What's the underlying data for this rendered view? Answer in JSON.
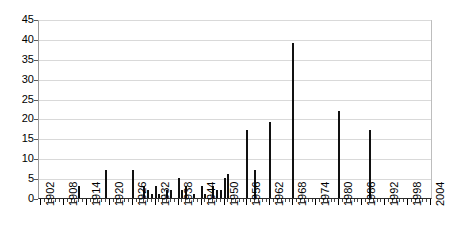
{
  "chart_data": {
    "type": "bar",
    "title": "",
    "xlabel": "",
    "ylabel": "",
    "ylim": [
      0,
      45
    ],
    "ytick_step": 5,
    "yticks": [
      0,
      5,
      10,
      15,
      20,
      25,
      30,
      35,
      40,
      45
    ],
    "xlim": [
      1902,
      2004
    ],
    "xtick_labels": [
      "1902",
      "1908",
      "1914",
      "1920",
      "1926",
      "1932",
      "1938",
      "1944",
      "1950",
      "1956",
      "1962",
      "1968",
      "1974",
      "1980",
      "1986",
      "1992",
      "1998",
      "2004"
    ],
    "xtick_step": 6,
    "grid": "horizontal",
    "legend": "none",
    "bar_color": "#111111",
    "grid_color": "#d9d9d9",
    "axis_color": "#2b2b2b",
    "categories": [
      1902,
      1903,
      1904,
      1905,
      1906,
      1907,
      1908,
      1909,
      1910,
      1911,
      1912,
      1913,
      1914,
      1915,
      1916,
      1917,
      1918,
      1919,
      1920,
      1921,
      1922,
      1923,
      1924,
      1925,
      1926,
      1927,
      1928,
      1929,
      1930,
      1931,
      1932,
      1933,
      1934,
      1935,
      1936,
      1937,
      1938,
      1939,
      1940,
      1941,
      1942,
      1943,
      1944,
      1945,
      1946,
      1947,
      1948,
      1949,
      1950,
      1951,
      1952,
      1953,
      1954,
      1955,
      1956,
      1957,
      1958,
      1959,
      1960,
      1961,
      1962,
      1963,
      1964,
      1965,
      1966,
      1967,
      1968,
      1969,
      1970,
      1971,
      1972,
      1973,
      1974,
      1975,
      1976,
      1977,
      1978,
      1979,
      1980,
      1981,
      1982,
      1983,
      1984,
      1985,
      1986,
      1987,
      1988,
      1989,
      1990,
      1991,
      1992,
      1993,
      1994,
      1995,
      1996,
      1997,
      1998,
      1999,
      2000,
      2001,
      2002,
      2003,
      2004
    ],
    "values": [
      0,
      0,
      0,
      0,
      0,
      0,
      0,
      0,
      0,
      0,
      3,
      0,
      0,
      0,
      0,
      0,
      0,
      7,
      0,
      0,
      0,
      0,
      0,
      0,
      7,
      0,
      0,
      3,
      2,
      1,
      3,
      1,
      0,
      2,
      2,
      0,
      5,
      2,
      3,
      0,
      1,
      0,
      3,
      1,
      0,
      3,
      2,
      2,
      5,
      6,
      0,
      0,
      0,
      0,
      17,
      0,
      7,
      0,
      0,
      0,
      19,
      0,
      0,
      0,
      0,
      0,
      39,
      0,
      0,
      0,
      0,
      0,
      0,
      0,
      0,
      0,
      0,
      0,
      22,
      0,
      0,
      0,
      0,
      0,
      0,
      0,
      17,
      0,
      0,
      0,
      0,
      0,
      0,
      0,
      0,
      0,
      0,
      0,
      0,
      0,
      0,
      0,
      0
    ]
  }
}
